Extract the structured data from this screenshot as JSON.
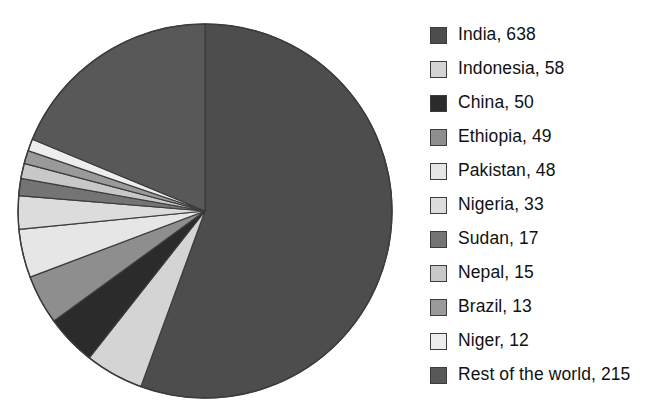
{
  "chart_data": {
    "type": "pie",
    "title": "",
    "subtitle": "",
    "xlabel": "",
    "ylabel": "",
    "grid": false,
    "legend_position": "right",
    "start_angle_deg": 0,
    "direction": "clockwise",
    "total": 1148,
    "units": "",
    "categories": [
      "India",
      "Indonesia",
      "China",
      "Ethiopia",
      "Pakistan",
      "Nigeria",
      "Sudan",
      "Nepal",
      "Brazil",
      "Niger",
      "Rest of the world"
    ],
    "values": [
      638,
      58,
      50,
      49,
      48,
      33,
      17,
      15,
      13,
      12,
      215
    ],
    "slices": [
      {
        "label": "India",
        "value": 638,
        "color": "#4d4d4d"
      },
      {
        "label": "Indonesia",
        "value": 58,
        "color": "#d4d4d4"
      },
      {
        "label": "China",
        "value": 50,
        "color": "#2b2b2b"
      },
      {
        "label": "Ethiopia",
        "value": 49,
        "color": "#8e8e8e"
      },
      {
        "label": "Pakistan",
        "value": 48,
        "color": "#e6e6e6"
      },
      {
        "label": "Nigeria",
        "value": 33,
        "color": "#dcdcdc"
      },
      {
        "label": "Sudan",
        "value": 17,
        "color": "#747474"
      },
      {
        "label": "Nepal",
        "value": 15,
        "color": "#c8c8c8"
      },
      {
        "label": "Brazil",
        "value": 13,
        "color": "#9a9a9a"
      },
      {
        "label": "Niger",
        "value": 12,
        "color": "#ededed"
      },
      {
        "label": "Rest of the world",
        "value": 215,
        "color": "#585858"
      }
    ]
  },
  "legend": {
    "items": [
      {
        "text": "India, 638",
        "color": "#4d4d4d"
      },
      {
        "text": "Indonesia, 58",
        "color": "#d4d4d4"
      },
      {
        "text": "China, 50",
        "color": "#2b2b2b"
      },
      {
        "text": "Ethiopia, 49",
        "color": "#8e8e8e"
      },
      {
        "text": "Pakistan, 48",
        "color": "#e6e6e6"
      },
      {
        "text": "Nigeria, 33",
        "color": "#dcdcdc"
      },
      {
        "text": "Sudan, 17",
        "color": "#747474"
      },
      {
        "text": "Nepal, 15",
        "color": "#c8c8c8"
      },
      {
        "text": "Brazil, 13",
        "color": "#9a9a9a"
      },
      {
        "text": "Niger, 12",
        "color": "#ededed"
      },
      {
        "text": "Rest of the world, 215",
        "color": "#585858"
      }
    ]
  },
  "style": {
    "slice_outline": "#3c3c3c",
    "background": "#ffffff",
    "center_x": 205,
    "center_y": 211,
    "radius": 187
  }
}
